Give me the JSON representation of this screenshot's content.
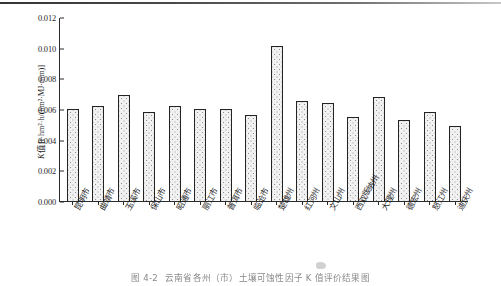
{
  "figure": {
    "caption_number": "图 4-2",
    "caption_text": "云南省各州（市）土壤可蚀性因子 K 值评价结果图"
  },
  "chart_data": {
    "type": "bar",
    "title": "",
    "xlabel": "",
    "ylabel": "K值 [t·hm²·h/(hm²·MJ·mm)]",
    "ylabel_symbol": "K",
    "ylabel_rest": "值 [t·hm²·h/(hm²·MJ·mm)]",
    "ylim": [
      0,
      0.012
    ],
    "yticks": [
      "0.000",
      "0.002",
      "0.004",
      "0.006",
      "0.008",
      "0.010",
      "0.012"
    ],
    "ytick_values": [
      0.0,
      0.002,
      0.004,
      0.006,
      0.008,
      0.01,
      0.012
    ],
    "grid": false,
    "legend": "none",
    "bar_fill_color": "#f1f1f1",
    "bar_edge_color": "#232323",
    "axis_color": "#2b2b2b",
    "categories": [
      "昆明市",
      "曲靖市",
      "玉溪市",
      "保山市",
      "昭通市",
      "丽江市",
      "普洱市",
      "临沧市",
      "楚雄州",
      "红河州",
      "文山州",
      "西双版纳州",
      "大理州",
      "德宏州",
      "怒江州",
      "迪庆州"
    ],
    "values": [
      0.006,
      0.0062,
      0.0069,
      0.0058,
      0.0062,
      0.006,
      0.006,
      0.0056,
      0.0101,
      0.0065,
      0.0064,
      0.0055,
      0.0068,
      0.0053,
      0.0058,
      0.0049
    ]
  }
}
